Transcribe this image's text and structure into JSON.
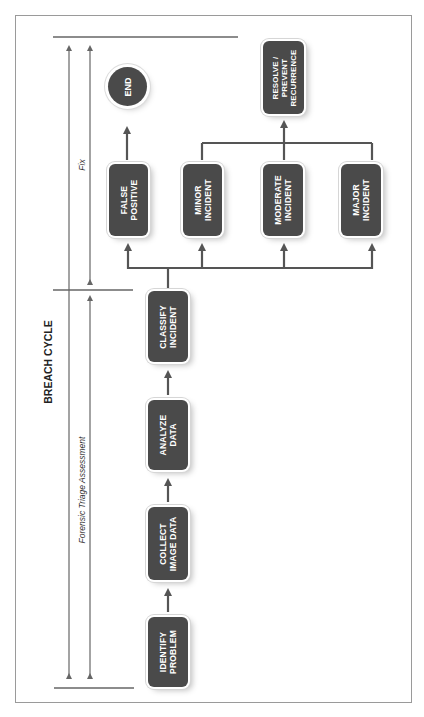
{
  "title": "BREACH CYCLE",
  "phases": {
    "fix": "Fix",
    "triage": "Forensic Triage Assessment"
  },
  "steps": {
    "identify": "IDENTIFY\nPROBLEM",
    "collect": "COLLECT\nIMAGE DATA",
    "analyze": "ANALYZE\nDATA",
    "classify": "CLASSIFY\nINCIDENT"
  },
  "classifications": {
    "false_positive": "FALSE\nPOSITIVE",
    "minor": "MINOR\nINCIDENT",
    "moderate": "MODERATE\nINCIDENT",
    "major": "MAJOR\nINCIDENT"
  },
  "outcomes": {
    "end": "END",
    "resolve": "RESOLVE /\nPREVENT\nRECURRENCE"
  },
  "colors": {
    "box_fill": "#4a4a4a",
    "line": "#555555",
    "text_on_box": "#ffffff"
  }
}
